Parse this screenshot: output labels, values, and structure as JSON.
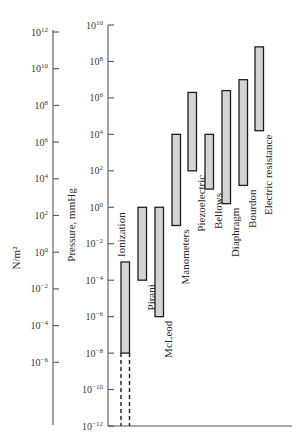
{
  "chart_data": {
    "type": "bar",
    "subtype": "floating-range (vertical, log scale)",
    "title": "",
    "left_axis": {
      "label": "N/m²",
      "scale": "log10",
      "ticks": [
        {
          "exp": 12,
          "text": "10",
          "sup": "12"
        },
        {
          "exp": 10,
          "text": "10",
          "sup": "10"
        },
        {
          "exp": 8,
          "text": "10",
          "sup": "8"
        },
        {
          "exp": 6,
          "text": "10",
          "sup": "6"
        },
        {
          "exp": 4,
          "text": "10",
          "sup": "4"
        },
        {
          "exp": 2,
          "text": "10",
          "sup": "2"
        },
        {
          "exp": 0,
          "text": "10",
          "sup": "0"
        },
        {
          "exp": -2,
          "text": "10",
          "sup": "−2"
        },
        {
          "exp": -4,
          "text": "10",
          "sup": "−4"
        },
        {
          "exp": -6,
          "text": "10",
          "sup": "−6"
        }
      ]
    },
    "right_axis": {
      "label": "Pressure, mmHg",
      "scale": "log10",
      "range_exp": [
        -12,
        10
      ],
      "ticks": [
        {
          "exp": 10,
          "text": "10",
          "sup": "10"
        },
        {
          "exp": 8,
          "text": "10",
          "sup": "8"
        },
        {
          "exp": 6,
          "text": "10",
          "sup": "6"
        },
        {
          "exp": 4,
          "text": "10",
          "sup": "4"
        },
        {
          "exp": 2,
          "text": "10",
          "sup": "2"
        },
        {
          "exp": 0,
          "text": "10",
          "sup": "0"
        },
        {
          "exp": -2,
          "text": "10",
          "sup": "−2"
        },
        {
          "exp": -4,
          "text": "10",
          "sup": "−4"
        },
        {
          "exp": -6,
          "text": "10",
          "sup": "−6"
        },
        {
          "exp": -8,
          "text": "10",
          "sup": "−8"
        },
        {
          "exp": -10,
          "text": "10",
          "sup": "−10"
        },
        {
          "exp": -12,
          "text": "10",
          "sup": "−12"
        }
      ]
    },
    "categories": [
      "Ionization",
      "Pirani",
      "McLeod",
      "Manometers",
      "Piezoelectric",
      "Bellows",
      "Diaphragm",
      "Bourdon",
      "Electric resistance"
    ],
    "ranges_mmHg_log10": [
      {
        "name": "Ionization",
        "low": -8,
        "high": -3,
        "extended_low_dashed": -12
      },
      {
        "name": "Pirani",
        "low": -4,
        "high": 0
      },
      {
        "name": "McLeod",
        "low": -6,
        "high": 0
      },
      {
        "name": "Manometers",
        "low": -1,
        "high": 4
      },
      {
        "name": "Piezoelectric",
        "low": 2,
        "high": 6.3
      },
      {
        "name": "Bellows",
        "low": 1,
        "high": 4
      },
      {
        "name": "Diaphragm",
        "low": 0.2,
        "high": 6.4
      },
      {
        "name": "Bourdon",
        "low": 1.2,
        "high": 7
      },
      {
        "name": "Electric resistance",
        "low": 4.2,
        "high": 8.8
      }
    ],
    "grid": false,
    "legend": null
  }
}
